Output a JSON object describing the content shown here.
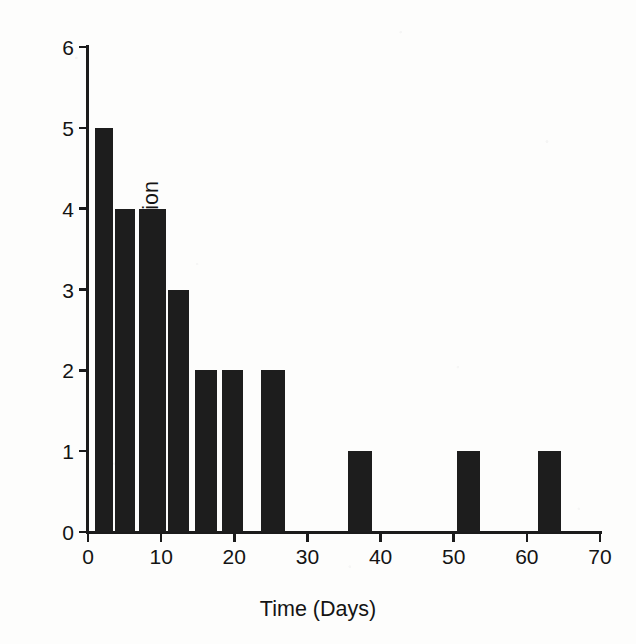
{
  "chart_data": {
    "type": "bar",
    "title": "",
    "xlabel": "Time (Days)",
    "ylabel": "Relative Level of Transfection",
    "xlim": [
      0,
      70
    ],
    "ylim": [
      0,
      6
    ],
    "xticks": [
      0,
      10,
      20,
      30,
      40,
      50,
      60,
      70
    ],
    "xtick_labels": [
      "0",
      "10",
      "20",
      "30",
      "40",
      "50",
      "60",
      "70"
    ],
    "yticks": [
      0,
      1,
      2,
      3,
      4,
      5,
      6
    ],
    "ytick_labels": [
      "0",
      "1",
      "2",
      "3",
      "4",
      "5",
      "6"
    ],
    "grid": false,
    "legend": null,
    "bar_color": "#1d1d1d",
    "background_color": "#fdfdfc",
    "axis_color": "#1b1b1b",
    "x": [
      1.0,
      3.7,
      7.0,
      11.0,
      14.6,
      18.3,
      23.7,
      35.6,
      50.5,
      61.5
    ],
    "bar_widths": [
      2.4,
      2.7,
      3.6,
      2.8,
      3.0,
      2.9,
      3.2,
      3.2,
      3.1,
      3.2
    ],
    "values": [
      5,
      4,
      4,
      3,
      2,
      2,
      2,
      1,
      1,
      1
    ],
    "categories": [
      "1",
      "4",
      "7",
      "11",
      "15",
      "18",
      "24",
      "36",
      "51",
      "62"
    ]
  },
  "figure": {
    "ylabel_text": "Relative Level of Transfection",
    "xlabel_text": "Time (Days)"
  }
}
